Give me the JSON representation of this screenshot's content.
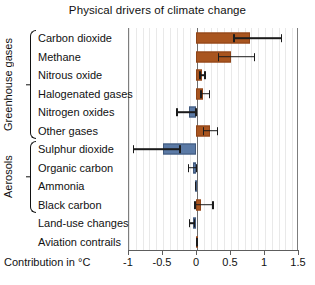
{
  "chart_data": {
    "type": "bar",
    "orientation": "horizontal",
    "title": "Physical drivers of climate change",
    "xlabel": "Contribution in °C",
    "ylabel": "",
    "xlim": [
      -1.0,
      1.5
    ],
    "xticks": [
      -1,
      -0.5,
      0,
      0.5,
      1,
      1.5
    ],
    "xticklabels": [
      "-1",
      "-0.5",
      "0",
      "0.5",
      "1",
      "1.5"
    ],
    "grid": "minor vertical gridlines",
    "legend": "none",
    "zero_reference_line": 0,
    "colors": {
      "positive": "#a9551f",
      "negative": "#5b7aa6",
      "error_bar": "#1b1b1b"
    },
    "categories": [
      "Carbon dioxide",
      "Methane",
      "Nitrous oxide",
      "Halogenated gases",
      "Nitrogen oxides",
      "Other gases",
      "Sulphur dioxide",
      "Organic carbon",
      "Ammonia",
      "Black carbon",
      "Land-use changes",
      "Aviation contrails"
    ],
    "values": [
      0.8,
      0.52,
      0.09,
      0.11,
      -0.1,
      0.2,
      -0.48,
      -0.04,
      -0.01,
      0.08,
      -0.05,
      0.01
    ],
    "error_low": [
      0.55,
      0.32,
      0.05,
      0.06,
      -0.29,
      0.1,
      -0.93,
      -0.12,
      -0.02,
      -0.03,
      -0.11,
      0.0
    ],
    "error_high": [
      1.27,
      0.87,
      0.14,
      0.21,
      0.01,
      0.33,
      -0.22,
      0.02,
      0.0,
      0.26,
      -0.01,
      0.03
    ],
    "groups": [
      {
        "label": "Greenhouse gases",
        "from": 0,
        "to": 5
      },
      {
        "label": "Aerosols",
        "from": 6,
        "to": 9
      }
    ]
  }
}
